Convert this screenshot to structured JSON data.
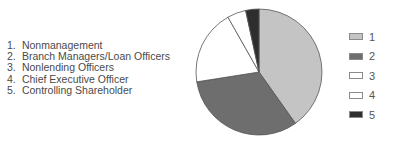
{
  "chart_data": {
    "type": "pie",
    "title": "",
    "categories": [
      "1",
      "2",
      "3",
      "4",
      "5"
    ],
    "category_labels": [
      "Nonmanagement",
      "Branch Managers/Loan Officers",
      "Nonlending Officers",
      "Chief Executive Officer",
      "Controlling Shareholder"
    ],
    "values": [
      40.2,
      32.3,
      19.3,
      4.8,
      3.4
    ],
    "colors": [
      "#c4c4c4",
      "#6e6e6e",
      "#ffffff",
      "#ffffff",
      "#2e2e2e"
    ],
    "start_angle": "12 o'clock",
    "direction": "clockwise",
    "legend_position": "right"
  },
  "key": {
    "items": [
      {
        "num": "1.",
        "label": "Nonmanagement"
      },
      {
        "num": "2.",
        "label": "Branch Managers/Loan Officers"
      },
      {
        "num": "3.",
        "label": "Nonlending Officers"
      },
      {
        "num": "4.",
        "label": "Chief Executive Officer"
      },
      {
        "num": "5.",
        "label": "Controlling Shareholder"
      }
    ]
  },
  "legend": {
    "items": [
      {
        "label": "1",
        "color": "#c4c4c4"
      },
      {
        "label": "2",
        "color": "#6e6e6e"
      },
      {
        "label": "3",
        "color": "#ffffff"
      },
      {
        "label": "4",
        "color": "#ffffff"
      },
      {
        "label": "5",
        "color": "#2e2e2e"
      }
    ]
  }
}
